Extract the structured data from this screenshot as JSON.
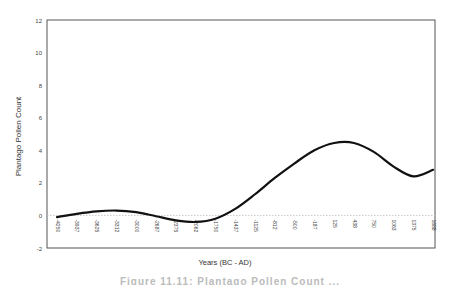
{
  "chart_data": {
    "type": "line",
    "title": "",
    "xlabel": "Years (BC - AD)",
    "ylabel": "Plantago Pollen Count",
    "ylim": [
      -2,
      12
    ],
    "yticks": [
      -2,
      0,
      2,
      4,
      6,
      8,
      10,
      12
    ],
    "categories": [
      "-4250",
      "-3937",
      "-3625",
      "-3312",
      "-3000",
      "-2687",
      "-2375",
      "-2062",
      "-1750",
      "-1437",
      "-1125",
      "-812",
      "-500",
      "-187",
      "125",
      "438",
      "750",
      "1063",
      "1375",
      "1688"
    ],
    "series": [
      {
        "name": "Plantago pollen (smoothed)",
        "color": "#111111",
        "values": [
          -0.1,
          0.1,
          0.25,
          0.3,
          0.2,
          -0.05,
          -0.3,
          -0.4,
          -0.2,
          0.4,
          1.3,
          2.3,
          3.2,
          4.0,
          4.45,
          4.45,
          3.9,
          3.0,
          2.4,
          2.8
        ]
      }
    ],
    "grid": false,
    "zero_line": "dotted",
    "legend": "none"
  },
  "caption": "Figure 11.11: Plantago Pollen Count ..."
}
